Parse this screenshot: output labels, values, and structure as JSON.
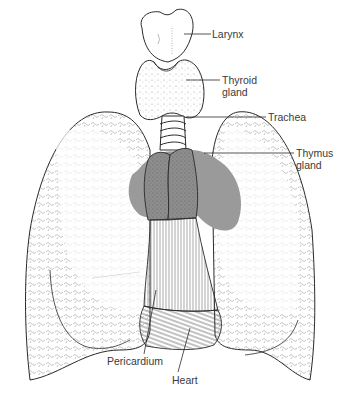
{
  "figure": {
    "colors": {
      "line": "#2a2a2a",
      "thymus_fill": "#8e8e8e",
      "stipple": "#6a6a6a",
      "background": "#ffffff",
      "label_text": "#3a3a3a"
    },
    "labels": [
      {
        "id": "larynx",
        "text": "Larynx"
      },
      {
        "id": "thyroid",
        "line1": "Thyroid",
        "line2": "gland"
      },
      {
        "id": "trachea",
        "text": "Trachea"
      },
      {
        "id": "thymus",
        "line1": "Thymus",
        "line2": "gland"
      },
      {
        "id": "pericardium",
        "text": "Pericardium"
      },
      {
        "id": "heart",
        "text": "Heart"
      }
    ]
  }
}
